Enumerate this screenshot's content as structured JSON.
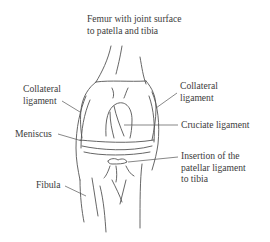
{
  "diagram": {
    "labels": {
      "femur": {
        "line1": "Femur with joint surface",
        "line2": "to patella and tibia"
      },
      "collateral_left": {
        "line1": "Collateral",
        "line2": "ligament"
      },
      "collateral_right": {
        "line1": "Collateral",
        "line2": "ligament"
      },
      "cruciate": {
        "line1": "Cruciate ligament"
      },
      "meniscus": {
        "line1": "Meniscus"
      },
      "patellar_insertion": {
        "line1": "Insertion of the",
        "line2": "patellar ligament",
        "line3": "to tibia"
      },
      "fibula": {
        "line1": "Fibula"
      }
    },
    "colors": {
      "line": "#555555",
      "text": "#3c3c3c",
      "background": "#ffffff"
    }
  }
}
